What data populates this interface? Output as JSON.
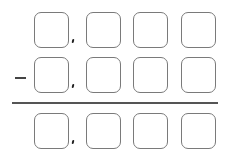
{
  "worksheet": {
    "operation": "subtraction",
    "operator_symbol": "minus",
    "rows": [
      {
        "role": "minuend",
        "digit_boxes": 4,
        "thousands_separator_after_box": 1
      },
      {
        "role": "subtrahend",
        "digit_boxes": 4,
        "thousands_separator_after_box": 1
      },
      {
        "role": "difference",
        "digit_boxes": 4,
        "thousands_separator_after_box": 1
      }
    ],
    "colors": {
      "box_border": "#7a7a7a",
      "rule": "#555555",
      "comma": "#222222"
    }
  }
}
